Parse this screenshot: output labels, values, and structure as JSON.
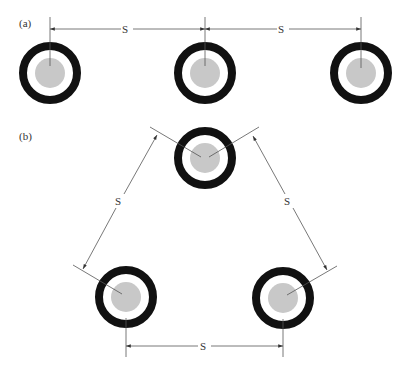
{
  "panels": {
    "a": {
      "label": "(a)",
      "arrangement": "flat / side-by-side",
      "spacing_labels": [
        "S",
        "S"
      ]
    },
    "b": {
      "label": "(b)",
      "arrangement": "trefoil / triangular",
      "spacing_labels": [
        "S",
        "S",
        "S"
      ]
    }
  },
  "cable": {
    "outer_sheath_color": "#111111",
    "insulation_color": "#ffffff",
    "conductor_color": "#c8c8c8"
  }
}
